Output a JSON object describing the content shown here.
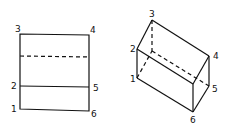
{
  "figure_left": {
    "description": "Rectangle with horizontal solid and dashed dividers",
    "labels": [
      "1",
      "2",
      "3",
      "4",
      "5",
      "6"
    ]
  },
  "figure_right": {
    "description": "Isometric rectangular prism with hidden edges dashed",
    "labels": [
      "1",
      "2",
      "3",
      "4",
      "5",
      "6"
    ]
  }
}
